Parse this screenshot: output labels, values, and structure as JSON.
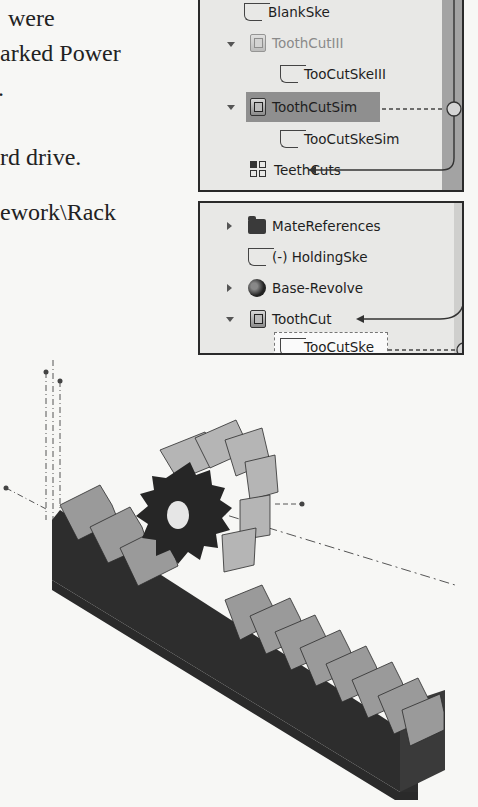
{
  "page_text": {
    "lines": [
      "were",
      "arked Power",
      ".",
      "rd drive.",
      "ework\\Rack"
    ]
  },
  "panel_top": {
    "items": [
      {
        "label": "BlankSke",
        "type": "sketch",
        "state": "normal"
      },
      {
        "label": "ToothCutIII",
        "type": "feature",
        "state": "faded",
        "expanded": true
      },
      {
        "label": "TooCutSkeIII",
        "type": "sketch",
        "state": "normal"
      },
      {
        "label": "ToothCutSim",
        "type": "feature",
        "state": "selected",
        "expanded": true
      },
      {
        "label": "TooCutSkeSim",
        "type": "sketch",
        "state": "normal"
      },
      {
        "label": "TeethCuts",
        "type": "pattern",
        "state": "normal"
      }
    ]
  },
  "panel_bottom": {
    "items": [
      {
        "label": "MateReferences",
        "type": "folder",
        "expanded": false
      },
      {
        "label": "(-) HoldingSke",
        "type": "sketch"
      },
      {
        "label": "Base-Revolve",
        "type": "revolve",
        "expanded": false
      },
      {
        "label": "ToothCut",
        "type": "feature",
        "expanded": true
      },
      {
        "label": "TooCutSke",
        "type": "sketch",
        "state": "hover"
      }
    ]
  },
  "model": {
    "description": "Isometric view of a spur gear meshing with a rack",
    "rack_teeth_count": 13,
    "gear_teeth_count": 12
  }
}
